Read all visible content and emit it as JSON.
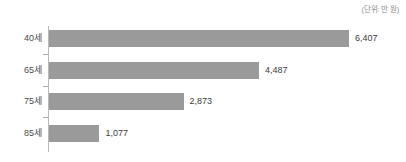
{
  "chart_data": {
    "type": "bar",
    "orientation": "horizontal",
    "title": "",
    "subtitle": "",
    "xlabel": "",
    "ylabel": "",
    "unit_note": "(단위: 만 원)",
    "categories": [
      "40세",
      "65세",
      "75세",
      "85세"
    ],
    "values": [
      6407,
      4487,
      2873,
      1077
    ],
    "value_labels": [
      "6,407",
      "4,487",
      "2,873",
      "1,077"
    ],
    "xlim": [
      0,
      6407
    ],
    "grid": false,
    "legend": null,
    "series": [
      {
        "name": "",
        "values": [
          6407,
          4487,
          2873,
          1077
        ]
      }
    ],
    "points": [
      {
        "category": "40세",
        "value": 6407,
        "label": "6,407"
      },
      {
        "category": "65세",
        "value": 4487,
        "label": "4,487"
      },
      {
        "category": "75세",
        "value": 2873,
        "label": "2,873"
      },
      {
        "category": "85세",
        "value": 1077,
        "label": "1,077"
      }
    ],
    "colors": {
      "bar": "#9a9a9a",
      "axis": "#b9b9b9",
      "category_label": "#4a4a4a",
      "value_label": "#3c3c3c",
      "unit_note": "#8d8d8d",
      "background": "#ffffff"
    }
  }
}
